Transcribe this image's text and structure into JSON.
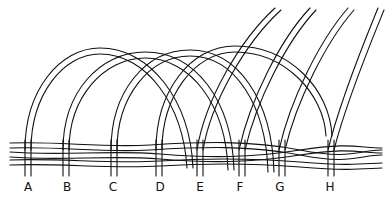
{
  "figure": {
    "labels": [
      {
        "text": "A",
        "x": 28
      },
      {
        "text": "B",
        "x": 67
      },
      {
        "text": "C",
        "x": 113
      },
      {
        "text": "D",
        "x": 160
      },
      {
        "text": "E",
        "x": 200
      },
      {
        "text": "F",
        "x": 240
      },
      {
        "text": "G",
        "x": 280
      },
      {
        "text": "H",
        "x": 330
      }
    ],
    "colors": {
      "ink": "#111111",
      "paper": "#ffffff"
    }
  }
}
